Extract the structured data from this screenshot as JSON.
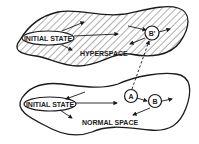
{
  "diagram": {
    "regions": [
      {
        "id": "hyperspace",
        "label": "HYPERSPACE",
        "style": "hatched"
      },
      {
        "id": "normal_space",
        "label": "NORMAL SPACE",
        "style": "plain"
      }
    ],
    "nodes": [
      {
        "id": "hyper_initial",
        "label": "INITIAL STATE",
        "shape": "ellipse",
        "region": "hyperspace"
      },
      {
        "id": "b_prime",
        "label": "B'",
        "shape": "circle",
        "region": "hyperspace"
      },
      {
        "id": "normal_initial",
        "label": "INITIAL STATE",
        "shape": "ellipse",
        "region": "normal_space"
      },
      {
        "id": "a",
        "label": "A",
        "shape": "circle",
        "region": "normal_space"
      },
      {
        "id": "b",
        "label": "B",
        "shape": "circle",
        "region": "normal_space"
      }
    ],
    "edges": [
      {
        "from": "a",
        "to": "b_prime",
        "style": "dashed"
      },
      {
        "from": "normal_initial",
        "to": "a",
        "style": "solid"
      },
      {
        "from": "a",
        "to": "b",
        "style": "solid"
      }
    ],
    "colors": {
      "ink": "#1a1a1a",
      "background": "#ffffff"
    }
  }
}
